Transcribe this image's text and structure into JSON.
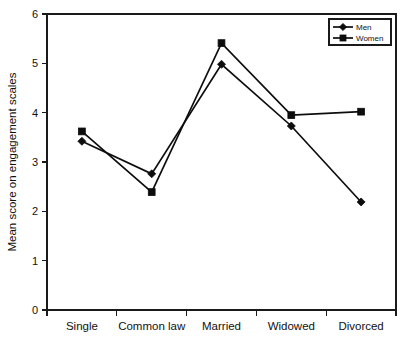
{
  "chart_data": {
    "type": "line",
    "title": "",
    "xlabel": "",
    "ylabel": "Mean score on engagement scales",
    "categories": [
      "Single",
      "Common law",
      "Married",
      "Widowed",
      "Divorced"
    ],
    "series": [
      {
        "name": "Men",
        "marker": "diamond",
        "values": [
          3.42,
          2.76,
          4.98,
          3.73,
          2.19
        ]
      },
      {
        "name": "Women",
        "marker": "square",
        "values": [
          3.62,
          2.39,
          5.41,
          3.95,
          4.02
        ]
      }
    ],
    "ylim": [
      0,
      6
    ],
    "yticks": [
      "0",
      "1",
      "2",
      "3",
      "4",
      "5",
      "6"
    ],
    "grid": false,
    "legend_position": "top-right",
    "legend_entries": [
      "Men",
      "Women"
    ],
    "colors": {
      "series": "#0d0d0d",
      "axis": "#1a1a1a",
      "background": "#ffffff"
    }
  }
}
